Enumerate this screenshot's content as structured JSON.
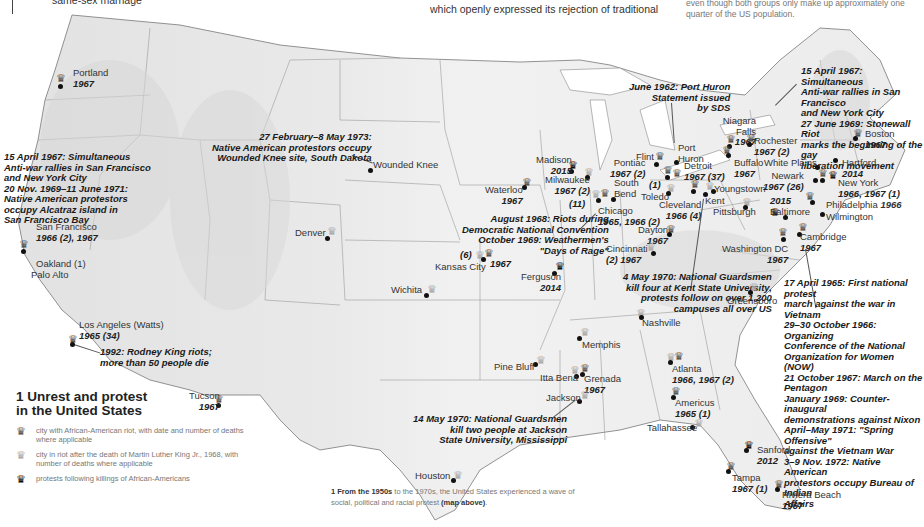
{
  "top_text": {
    "left_fragment": "same-sex marriage",
    "center_fragment": "which openly expressed its rejection of traditional",
    "right_fragment": "even though both groups only make up approximately one\nquarter of the US population."
  },
  "legend": {
    "title": "1 Unrest and protest\nin the United States",
    "items": [
      {
        "icon": "crown-dark-icon",
        "text": "city with African-American riot, with date and number of deaths where applicable"
      },
      {
        "icon": "crown-light-icon",
        "text": "city in riot after the death of Martin Luther King Jr., 1968, with number of deaths where applicable"
      },
      {
        "icon": "crown-black-icon",
        "text": "protests following killings of African-Americans"
      }
    ]
  },
  "caption": {
    "bold_lead": "1 From the 1950s",
    "text": " to the 1970s, the United States experienced a wave of social, political and racial protest ",
    "bold_tail": "(map above)",
    "end": "."
  },
  "cities": [
    {
      "name": "Portland",
      "year": "1967",
      "x": 61,
      "y": 70
    },
    {
      "name": "San Francisco",
      "year": "1966 (2), 1967",
      "x": 36,
      "y": 222
    },
    {
      "name": "Oakland (1)",
      "year": "",
      "x": 36,
      "y": 259
    },
    {
      "name": "Palo Alto",
      "year": "",
      "x": 31,
      "y": 270
    },
    {
      "name": "Los Angeles (Watts)",
      "year": "1965 (34)",
      "x": 79,
      "y": 320
    },
    {
      "name": "Tucson",
      "year": "1967",
      "x": 189,
      "y": 391
    },
    {
      "name": "Wounded Knee",
      "year": "",
      "x": 371,
      "y": 158
    },
    {
      "name": "Denver",
      "year": "",
      "x": 295,
      "y": 228
    },
    {
      "name": "Wichita",
      "year": "",
      "x": 391,
      "y": 285
    },
    {
      "name": "Kansas City",
      "year": "",
      "x": 435,
      "y": 262
    },
    {
      "name": "Waterloo",
      "year": "1967",
      "x": 485,
      "y": 185
    },
    {
      "name": "Madison",
      "year": "2015",
      "x": 536,
      "y": 155
    },
    {
      "name": "Milwaukee",
      "year": "1967 (2)",
      "x": 545,
      "y": 175
    },
    {
      "name": "Chicago",
      "year": "1965, 1966 (2)",
      "x": 598,
      "y": 206
    },
    {
      "name": "South Bend",
      "year": "",
      "x": 614,
      "y": 178
    },
    {
      "name": "Pontiac",
      "year": "1967 (2)",
      "x": 610,
      "y": 158
    },
    {
      "name": "Flint",
      "year": "",
      "x": 636,
      "y": 152
    },
    {
      "name": "Port Huron",
      "year": "",
      "x": 678,
      "y": 143
    },
    {
      "name": "Detroit",
      "year": "1967 (37)",
      "x": 684,
      "y": 161
    },
    {
      "name": "Toledo",
      "year": "",
      "x": 641,
      "y": 192
    },
    {
      "name": "Cleveland",
      "year": "1966 (4)",
      "x": 659,
      "y": 200
    },
    {
      "name": "Kent",
      "year": "",
      "x": 705,
      "y": 196
    },
    {
      "name": "Youngstown",
      "year": "",
      "x": 714,
      "y": 184
    },
    {
      "name": "Pittsburgh",
      "year": "",
      "x": 713,
      "y": 207
    },
    {
      "name": "Dayton",
      "year": "1967",
      "x": 638,
      "y": 225
    },
    {
      "name": "Cincinnati",
      "year": "(2)    1967",
      "x": 606,
      "y": 244
    },
    {
      "name": "Niagara Falls",
      "year": "1967",
      "x": 722,
      "y": 118
    },
    {
      "name": "Rochester",
      "year": "1967 (2)",
      "x": 754,
      "y": 136
    },
    {
      "name": "Buffalo",
      "year": "1967",
      "x": 734,
      "y": 158
    },
    {
      "name": "White Plains",
      "year": "",
      "x": 764,
      "y": 158
    },
    {
      "name": "Newark",
      "year": "1967 (26)",
      "x": 763,
      "y": 171
    },
    {
      "name": "Hartford",
      "year": "2014",
      "x": 842,
      "y": 158
    },
    {
      "name": "New York",
      "year": "1966, 1967 (1)",
      "x": 838,
      "y": 178
    },
    {
      "name": "Boston",
      "year": "1967",
      "x": 865,
      "y": 129
    },
    {
      "name": "Baltimore",
      "year": "2015",
      "x": 770,
      "y": 209
    },
    {
      "name": "Philadelphia",
      "year": "1966",
      "x": 826,
      "y": 200
    },
    {
      "name": "Wilmington",
      "year": "",
      "x": 826,
      "y": 212
    },
    {
      "name": "Cambridge",
      "year": "1967",
      "x": 800,
      "y": 232
    },
    {
      "name": "Washington DC",
      "year": "1967",
      "x": 722,
      "y": 244
    },
    {
      "name": "Greensboro",
      "year": "",
      "x": 727,
      "y": 296
    },
    {
      "name": "Ferguson",
      "year": "2014",
      "x": 521,
      "y": 272
    },
    {
      "name": "Nashville",
      "year": "",
      "x": 642,
      "y": 318
    },
    {
      "name": "Memphis",
      "year": "",
      "x": 582,
      "y": 340
    },
    {
      "name": "Pine Bluff",
      "year": "",
      "x": 494,
      "y": 362
    },
    {
      "name": "Itta Bena",
      "year": "",
      "x": 540,
      "y": 373
    },
    {
      "name": "Grenada",
      "year": "1967",
      "x": 584,
      "y": 374
    },
    {
      "name": "Jackson",
      "year": "",
      "x": 546,
      "y": 393
    },
    {
      "name": "Atlanta",
      "year": "1966, 1967 (2)",
      "x": 672,
      "y": 364
    },
    {
      "name": "Americus",
      "year": "1965 (1)",
      "x": 675,
      "y": 398
    },
    {
      "name": "Tallahassee",
      "year": "",
      "x": 647,
      "y": 423
    },
    {
      "name": "Sanford",
      "year": "2012",
      "x": 757,
      "y": 445
    },
    {
      "name": "Tampa",
      "year": "1967 (1)",
      "x": 732,
      "y": 470
    },
    {
      "name": "Riviera Beach",
      "year": "1967",
      "x": 782,
      "y": 490
    },
    {
      "name": "Houston",
      "year": "",
      "x": 415,
      "y": 467
    }
  ],
  "notes": {
    "west_coast": "15 April 1967: Simultaneous\nAnti-war rallies in San Francisco\nand New York City\n20 Nov. 1969–11 June 1971:\nNative American protestors\noccupy Alcatraz island in\nSan Francisco Bay",
    "wounded_knee": "27 February–8 May 1973:\nNative American protestors occupy\nWounded Knee site, South Dakota",
    "la_1992": "1992: Rodney King riots;\nmore than 50 people die",
    "chicago_1968": "August 1968: Riots during\nDemocratic National Convention\nOctober 1969: Weathermen's\n\"Days of Rage\"",
    "port_huron": "June 1962: Port Huron\nStatement issued\nby SDS",
    "new_york": "15 April 1967: Simultaneous\nAnti-war rallies in San Francisco\nand New York City\n27 June 1969: Stonewall Riot\nmarks the beginning of the gay\nliberation movement",
    "kent_state": "4 May 1970: National Guardsmen\nkill four at Kent State University,\nprotests follow on over 1,200\ncampuses all over US",
    "washington": "17 April 1965: First national protest\nmarch against the war in Vietnam\n29–30 October 1966: Organizing\nConference of the National\nOrganization for Women (NOW)\n21 October 1967: March on the\nPentagon\nJanuary 1969: Counter-inaugural\ndemonstrations against Nixon\nApril–May 1971: \"Spring Offensive\"\nagainst the Vietnam War\n3–9 Nov. 1972: Native American\nprotestors occupy Bureau of Indian\nAffairs",
    "jackson_state": "14 May 1970: National Guardsmen\nkill two people at Jackson\nState University, Mississippi",
    "chicago_deaths": "(11)",
    "kansas_city_deaths": "(6)",
    "kansas_city_year": "1967",
    "detroit_mlk": "(1)"
  },
  "colors": {
    "land": "#ececec",
    "state_lines": "#8a8a8a",
    "ink": "#1a1a1a",
    "crown_dark": "#555555",
    "crown_light": "#aaaaaa",
    "crown_black": "#111111"
  }
}
